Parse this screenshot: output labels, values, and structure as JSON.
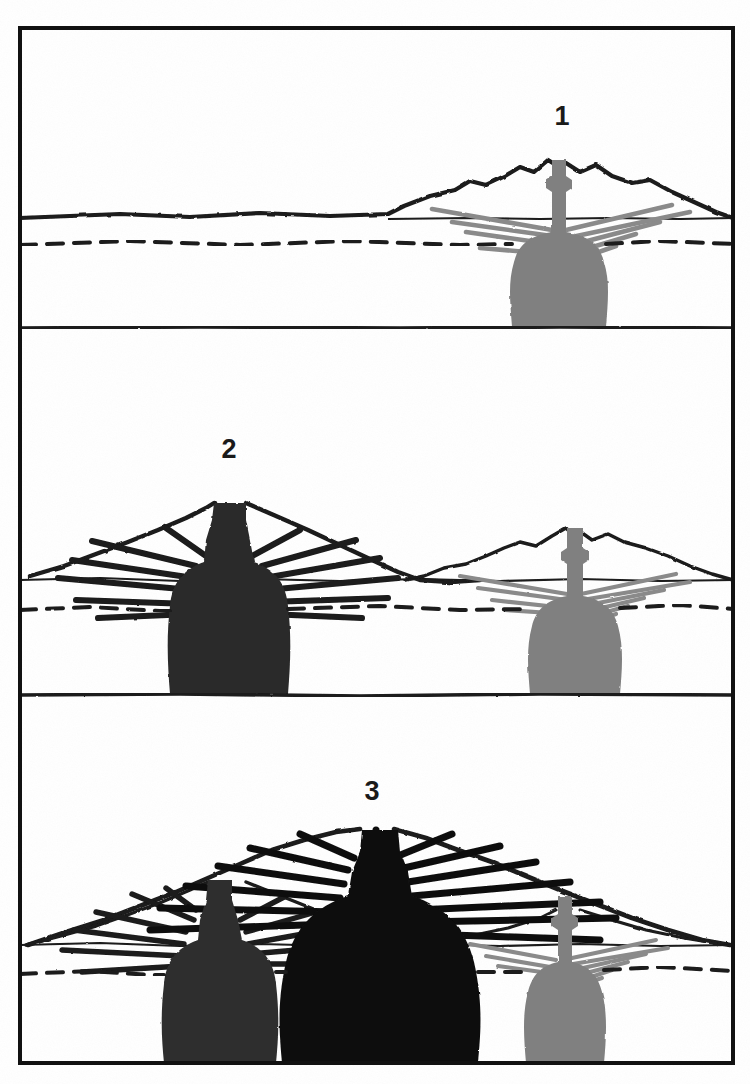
{
  "figure": {
    "type": "cross-section-diagram",
    "width": 750,
    "height": 1084,
    "background_color": "#ffffff",
    "frame": {
      "stroke_color": "#111111",
      "stroke_width": 4,
      "x": 18,
      "y": 26,
      "width": 717,
      "height": 1039
    },
    "panel_dividers": [
      {
        "name": "divider-1-2",
        "y": 336
      },
      {
        "name": "divider-2-3",
        "y": 703
      }
    ]
  },
  "legend_semantics": {
    "magma_oldest_label": "oldest magma body (light gray)",
    "magma_intermediate_label": "intermediate magma body (dark gray)",
    "magma_youngest_label": "youngest magma body (black)",
    "dashed_line_label": "subsurface horizon / basement contact (dashed)",
    "solid_baseline_label": "base of section (solid)",
    "edifice_label": "volcanic edifice outline",
    "dike_label": "radiating dike swarm"
  },
  "colors": {
    "ink": "#1a1a1a",
    "magma_light": "#808080",
    "magma_mid": "#2e2e2e",
    "magma_dark": "#141414",
    "dike_light": "#8a8a8a",
    "dike_dark": "#1a1a1a",
    "paper": "#ffffff",
    "frame": "#111111"
  },
  "panels": [
    {
      "id": "panel-1",
      "number": "1",
      "number_x": 562,
      "number_y": 125,
      "caption_semantic": "Stage 1: a single young volcano with its magma reservoir and radiating dikes",
      "ground_line_y": 218,
      "dashed_line_y": 243,
      "base_line_y": 328,
      "volcanoes": [
        {
          "name": "volcano-a",
          "age_rank": 1,
          "tone": "light",
          "summit_x": 558,
          "summit_y": 160,
          "base_left_x": 385,
          "base_right_x": 735,
          "chamber_center_x": 558,
          "chamber_top_y": 232,
          "chamber_bottom_y": 327,
          "chamber_half_width": 45,
          "dike_count": 10
        }
      ]
    },
    {
      "id": "panel-2",
      "number": "2",
      "number_x": 229,
      "number_y": 458,
      "caption_semantic": "Stage 2: a second, younger volcano grows beside the older, now-buried edifice",
      "ground_line_y": 580,
      "dashed_line_y": 608,
      "base_line_y": 695,
      "volcanoes": [
        {
          "name": "volcano-a",
          "age_rank": 1,
          "tone": "light",
          "summit_x": 573,
          "summit_y": 527,
          "base_left_x": 405,
          "base_right_x": 735,
          "chamber_center_x": 573,
          "chamber_top_y": 598,
          "chamber_bottom_y": 694,
          "chamber_half_width": 45,
          "dike_count": 10
        },
        {
          "name": "volcano-b",
          "age_rank": 2,
          "tone": "dark",
          "summit_x": 228,
          "summit_y": 503,
          "base_left_x": 40,
          "base_right_x": 430,
          "chamber_center_x": 228,
          "chamber_top_y": 565,
          "chamber_bottom_y": 694,
          "chamber_half_width": 52,
          "dike_count": 12
        }
      ]
    },
    {
      "id": "panel-3",
      "number": "3",
      "number_x": 372,
      "number_y": 800,
      "caption_semantic": "Stage 3: a third volcano overprints the composite edifice; three nested magma bodies of different ages",
      "ground_line_y": 945,
      "dashed_line_y": 972,
      "base_line_y": 1063,
      "volcanoes": [
        {
          "name": "volcano-a",
          "age_rank": 1,
          "tone": "light",
          "summit_x": 563,
          "summit_y": 895,
          "base_left_x": 420,
          "base_right_x": 735,
          "chamber_center_x": 563,
          "chamber_top_y": 962,
          "chamber_bottom_y": 1063,
          "chamber_half_width": 43,
          "dike_count": 9
        },
        {
          "name": "volcano-b",
          "age_rank": 2,
          "tone": "mid",
          "summit_x": 214,
          "summit_y": 880,
          "base_left_x": 30,
          "base_right_x": 420,
          "chamber_center_x": 214,
          "chamber_top_y": 930,
          "chamber_bottom_y": 1063,
          "chamber_half_width": 52,
          "dike_count": 11
        },
        {
          "name": "volcano-c",
          "age_rank": 3,
          "tone": "black",
          "summit_x": 375,
          "summit_y": 830,
          "base_left_x": 45,
          "base_right_x": 730,
          "chamber_center_x": 375,
          "chamber_top_y": 880,
          "chamber_bottom_y": 1063,
          "chamber_half_width": 88,
          "dike_count": 14
        }
      ]
    }
  ]
}
